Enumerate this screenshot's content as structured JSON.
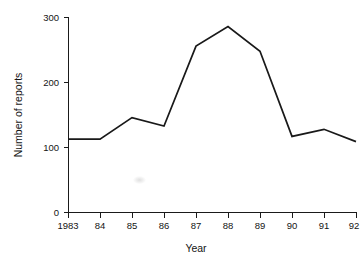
{
  "chart_data": {
    "type": "line",
    "title": "",
    "xlabel": "Year",
    "ylabel": "Number of reports",
    "categories": [
      "1983",
      "84",
      "85",
      "86",
      "87",
      "88",
      "89",
      "90",
      "91",
      "92"
    ],
    "x": [
      1983,
      1984,
      1985,
      1986,
      1987,
      1988,
      1989,
      1990,
      1991,
      1992
    ],
    "values": [
      113,
      113,
      146,
      133,
      256,
      286,
      248,
      117,
      128,
      109
    ],
    "series": [
      {
        "name": "Number of reports",
        "values": [
          113,
          113,
          146,
          133,
          256,
          286,
          248,
          117,
          128,
          109
        ]
      }
    ],
    "ylim": [
      0,
      300
    ],
    "yticks": [
      0,
      100,
      200,
      300
    ],
    "yticklabels": [
      "0",
      "100",
      "200",
      "300"
    ],
    "xticklabels": [
      "1983",
      "84",
      "85",
      "86",
      "87",
      "88",
      "89",
      "90",
      "91",
      "92"
    ],
    "grid": false,
    "legend": false,
    "legend_position": "none",
    "line_color": "#191919"
  },
  "axes": {
    "y_label": "Number of reports",
    "x_label": "Year",
    "y_tick_labels": [
      "300",
      "200",
      "100",
      "0"
    ],
    "x_tick_labels": [
      "1983",
      "84",
      "85",
      "86",
      "87",
      "88",
      "89",
      "90",
      "91",
      "92"
    ]
  }
}
